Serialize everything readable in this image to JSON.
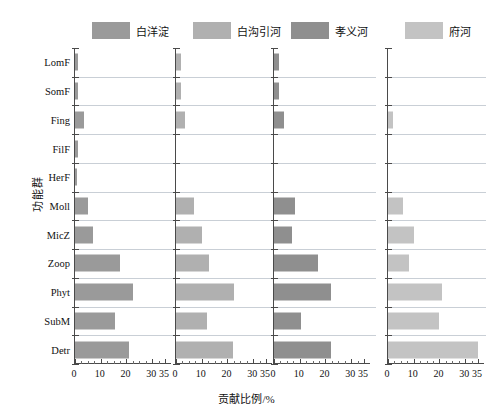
{
  "chart_data": {
    "type": "bar",
    "orientation": "horizontal",
    "title": "",
    "xlabel": "贡献比例/%",
    "ylabel": "功能群",
    "xlim": [
      0,
      35
    ],
    "ylim": [
      0,
      11
    ],
    "grid": true,
    "legend_position": "top of each panel",
    "xticks": [
      0,
      10,
      20,
      30,
      35
    ],
    "xticklabels": [
      "0",
      "10",
      "20",
      "30",
      "35"
    ],
    "minor_tick_step": 2.5,
    "categories": [
      "LomF",
      "SomF",
      "Fing",
      "FilF",
      "HerF",
      "Moll",
      "MicZ",
      "Zoop",
      "Phyt",
      "SubM",
      "Detr"
    ],
    "panels": [
      {
        "name": "白洋淀",
        "color": "#9a9a9a",
        "values": [
          1.3,
          1.3,
          3.5,
          1.0,
          0.8,
          5.0,
          7.0,
          17.5,
          22.5,
          15.5,
          21.0
        ]
      },
      {
        "name": "白沟引河",
        "color": "#b0b0b0",
        "values": [
          2.0,
          2.0,
          3.5,
          0.0,
          0.0,
          7.0,
          10.0,
          13.0,
          22.5,
          12.0,
          22.0
        ]
      },
      {
        "name": "孝义河",
        "color": "#8f8f8f",
        "values": [
          2.0,
          2.0,
          4.0,
          0.0,
          0.0,
          8.0,
          7.0,
          17.0,
          22.0,
          10.5,
          22.0
        ]
      },
      {
        "name": "府河",
        "color": "#c3c3c3",
        "values": [
          0.0,
          0.0,
          2.0,
          0.0,
          0.0,
          6.0,
          10.0,
          8.0,
          21.0,
          20.0,
          35.0
        ]
      }
    ]
  },
  "axis": {
    "ylabel": "功能群",
    "xlabel": "贡献比例/%"
  }
}
